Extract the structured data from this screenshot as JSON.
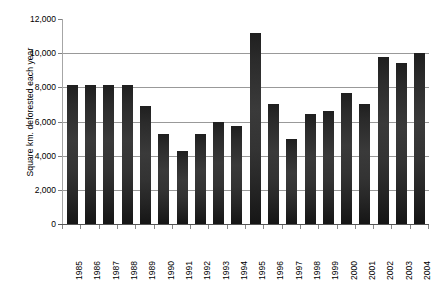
{
  "chart_data": {
    "type": "bar",
    "title": "",
    "subtitle": "",
    "xlabel": "",
    "ylabel": "Square km. deforested each year",
    "categories": [
      "1985",
      "1986",
      "1987",
      "1988",
      "1989",
      "1990",
      "1991",
      "1992",
      "1993",
      "1994",
      "1995",
      "1996",
      "1997",
      "1998",
      "1999",
      "2000",
      "2001",
      "2002",
      "2003",
      "2004"
    ],
    "values": [
      8150,
      8150,
      8150,
      8130,
      6900,
      5300,
      4280,
      5300,
      5950,
      5750,
      11200,
      7000,
      5000,
      6450,
      6600,
      7650,
      7000,
      9800,
      9400,
      10000
    ],
    "ylim": [
      0,
      12000
    ],
    "ytick_values": [
      0,
      2000,
      4000,
      6000,
      8000,
      10000,
      12000
    ],
    "ytick_labels": [
      "0",
      "2,000",
      "4,000",
      "6,000",
      "8,000",
      "10,000",
      "12,000"
    ],
    "grid": true,
    "grid_axis": "y",
    "legend": null,
    "legend_position": "none",
    "series_color": "#2b2b2b",
    "grid_color": "#999999",
    "axis_color": "#555555",
    "background_color": "#ffffff",
    "xtick_rotation": -90,
    "bar_count": 20
  }
}
